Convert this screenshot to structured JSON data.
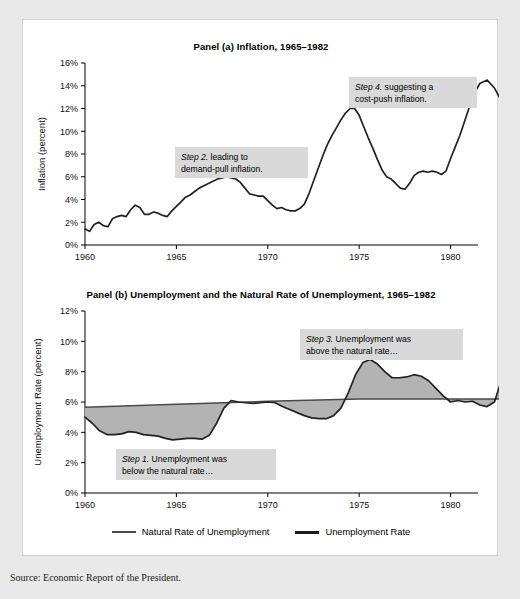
{
  "figure": {
    "source_note": "Source: Economic Report of the President."
  },
  "legend": {
    "items": [
      {
        "label": "Natural Rate of Unemployment",
        "color": "#4a4a4a"
      },
      {
        "label": "Unemployment Rate",
        "color": "#1c1c1c"
      }
    ]
  },
  "panel_a": {
    "title": "Panel (a) Inflation, 1965–1982",
    "annotations": [
      {
        "step": "Step 2.",
        "text": " leading to",
        "line2": "demand-pull inflation."
      },
      {
        "step": "Step 4.",
        "text": " suggesting a",
        "line2": "cost-push inflation."
      }
    ]
  },
  "panel_b": {
    "title": "Panel (b) Unemployment and the Natural Rate of Unemployment, 1965–1982",
    "annotations": [
      {
        "step": "Step 1.",
        "text": " Unemployment was",
        "line2": "below the natural rate…"
      },
      {
        "step": "Step 3.",
        "text": " Unemployment was",
        "line2": "above the natural rate…"
      }
    ]
  },
  "chart_data": [
    {
      "type": "line",
      "id": "panel-a",
      "title": "Panel (a) Inflation, 1965–1982",
      "xlabel": "Year",
      "ylabel": "Inflation (percent)",
      "xlim": [
        1960,
        1981.5
      ],
      "ylim": [
        0,
        16
      ],
      "xticks": [
        1960,
        1965,
        1970,
        1975,
        1980
      ],
      "xticklabels": [
        "1960",
        "1965",
        "1970",
        "1975",
        "1980"
      ],
      "yticks": [
        0,
        2,
        4,
        6,
        8,
        10,
        12,
        14,
        16
      ],
      "yticklabels": [
        "0%",
        "2%",
        "4%",
        "6%",
        "8%",
        "10%",
        "12%",
        "14%",
        "16%"
      ],
      "grid": false,
      "legend": "none",
      "series": [
        {
          "name": "Inflation Rate",
          "color": "#222222",
          "x": [
            1960.0,
            1960.25,
            1960.5,
            1960.75,
            1961.0,
            1961.25,
            1961.5,
            1961.75,
            1962.0,
            1962.25,
            1962.5,
            1962.75,
            1963.0,
            1963.25,
            1963.5,
            1963.75,
            1964.0,
            1964.25,
            1964.5,
            1964.75,
            1965.0,
            1965.25,
            1965.5,
            1965.75,
            1966.0,
            1966.25,
            1966.5,
            1966.75,
            1967.0,
            1967.25,
            1967.5,
            1967.75,
            1968.0,
            1968.25,
            1968.5,
            1968.75,
            1969.0,
            1969.25,
            1969.5,
            1969.75,
            1970.0,
            1970.25,
            1970.5,
            1970.75,
            1971.0,
            1971.25,
            1971.5,
            1971.75,
            1972.0,
            1972.25,
            1972.5,
            1972.75,
            1973.0,
            1973.25,
            1973.5,
            1973.75,
            1974.0,
            1974.25,
            1974.5,
            1974.75,
            1975.0,
            1975.25,
            1975.5,
            1975.75,
            1976.0,
            1976.25,
            1976.5,
            1976.75,
            1977.0,
            1977.25,
            1977.5,
            1977.75,
            1978.0,
            1978.25,
            1978.5,
            1978.75,
            1979.0,
            1979.25,
            1979.5,
            1979.75,
            1980.0,
            1980.25,
            1980.5,
            1980.75,
            1981.0,
            1981.25
          ],
          "y": [
            1.4,
            1.2,
            1.8,
            2.0,
            1.7,
            1.6,
            2.3,
            2.5,
            2.6,
            2.5,
            3.1,
            3.5,
            3.3,
            2.7,
            2.7,
            2.9,
            2.8,
            2.6,
            2.5,
            3.0,
            3.4,
            3.8,
            4.2,
            4.4,
            4.7,
            5.0,
            5.2,
            5.4,
            5.6,
            5.8,
            5.9,
            6.0,
            5.9,
            5.8,
            5.5,
            5.0,
            4.5,
            4.4,
            4.3,
            4.3,
            3.9,
            3.5,
            3.2,
            3.3,
            3.1,
            3.0,
            3.0,
            3.2,
            3.6,
            4.5,
            5.6,
            6.7,
            7.8,
            8.8,
            9.6,
            10.3,
            11.0,
            11.6,
            12.0,
            12.0,
            11.4,
            10.4,
            9.4,
            8.5,
            7.5,
            6.6,
            6.0,
            5.8,
            5.4,
            5.0,
            4.9,
            5.4,
            6.1,
            6.4,
            6.5,
            6.4,
            6.5,
            6.4,
            6.2,
            6.5,
            7.6,
            8.6,
            9.6,
            10.8,
            12.0,
            13.2
          ],
          "tail_x": [
            1981.25,
            1981.6,
            1982.0,
            1982.4,
            1982.8
          ],
          "tail_y": [
            13.2,
            14.2,
            14.5,
            13.8,
            12.6
          ]
        }
      ]
    },
    {
      "type": "line",
      "id": "panel-b",
      "title": "Panel (b) Unemployment and the Natural Rate of Unemployment, 1965–1982",
      "xlabel": "Year",
      "ylabel": "Unemployment Rate (percent)",
      "xlim": [
        1960,
        1981.5
      ],
      "ylim": [
        0,
        12
      ],
      "xticks": [
        1960,
        1965,
        1970,
        1975,
        1980
      ],
      "xticklabels": [
        "1960",
        "1965",
        "1970",
        "1975",
        "1980"
      ],
      "yticks": [
        0,
        2,
        4,
        6,
        8,
        10,
        12
      ],
      "yticklabels": [
        "0%",
        "2%",
        "4%",
        "6%",
        "8%",
        "10%",
        "12%"
      ],
      "grid": false,
      "legend": "bottom",
      "fill_between": {
        "between": [
          "Unemployment Rate",
          "Natural Rate of Unemployment"
        ],
        "color": "#b3b3b3"
      },
      "series": [
        {
          "name": "Natural Rate of Unemployment",
          "color": "#4a4a4a",
          "x": [
            1960,
            1965,
            1970,
            1975,
            1980,
            1982.8
          ],
          "y": [
            5.65,
            5.85,
            6.05,
            6.2,
            6.2,
            6.2
          ]
        },
        {
          "name": "Unemployment Rate",
          "color": "#1c1c1c",
          "x": [
            1960.0,
            1960.4,
            1960.8,
            1961.2,
            1961.6,
            1962.0,
            1962.4,
            1962.8,
            1963.2,
            1963.6,
            1964.0,
            1964.4,
            1964.8,
            1965.2,
            1965.6,
            1966.0,
            1966.4,
            1966.8,
            1967.2,
            1967.6,
            1968.0,
            1968.4,
            1968.8,
            1969.2,
            1969.6,
            1970.0,
            1970.4,
            1970.8,
            1971.2,
            1971.6,
            1972.0,
            1972.4,
            1972.8,
            1973.2,
            1973.6,
            1974.0,
            1974.4,
            1974.8,
            1975.2,
            1975.6,
            1976.0,
            1976.4,
            1976.8,
            1977.2,
            1977.6,
            1978.0,
            1978.4,
            1978.8,
            1979.2,
            1979.6,
            1980.0,
            1980.4,
            1980.8,
            1981.2,
            1981.6,
            1982.0,
            1982.4,
            1982.8
          ],
          "y": [
            5.0,
            4.6,
            4.1,
            3.85,
            3.85,
            3.9,
            4.05,
            4.0,
            3.85,
            3.8,
            3.75,
            3.6,
            3.5,
            3.55,
            3.6,
            3.6,
            3.55,
            3.8,
            4.6,
            5.6,
            6.1,
            6.0,
            5.95,
            5.9,
            5.95,
            6.0,
            5.95,
            5.7,
            5.5,
            5.3,
            5.1,
            4.95,
            4.9,
            4.9,
            5.1,
            5.6,
            6.6,
            7.8,
            8.6,
            8.8,
            8.5,
            8.0,
            7.6,
            7.6,
            7.65,
            7.8,
            7.7,
            7.4,
            6.9,
            6.4,
            6.0,
            6.1,
            6.0,
            6.05,
            5.8,
            5.7,
            6.0,
            7.5
          ]
        }
      ]
    }
  ]
}
